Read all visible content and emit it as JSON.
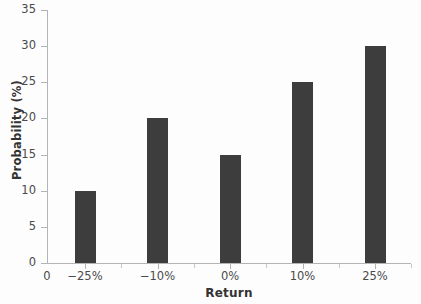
{
  "chart_data": {
    "type": "bar",
    "title": "",
    "subtitle": "",
    "xlabel": "Return",
    "ylabel": "Probability (%)",
    "categories": [
      "-25%",
      "-10%",
      "0%",
      "10%",
      "25%"
    ],
    "values": [
      10,
      20,
      15,
      25,
      30
    ],
    "series": [
      {
        "name": "Probability",
        "values": [
          10,
          20,
          15,
          25,
          30
        ]
      }
    ],
    "ylim": [
      0,
      35
    ],
    "ytick_labels": [
      "0",
      "5",
      "10",
      "15",
      "20",
      "25",
      "30",
      "35"
    ],
    "ytick_values": [
      0,
      5,
      10,
      15,
      20,
      25,
      30,
      35
    ],
    "xtick_labels": [
      "−25%",
      "−10%",
      "0%",
      "10%",
      "25%"
    ],
    "origin_label": "0",
    "grid": false,
    "legend": "none",
    "bar_color": "#3d3d3d",
    "axis_color": "#b4b4b4",
    "text_color": "#4a4a4a",
    "background_color": "#fdfdfd",
    "annotations": []
  }
}
